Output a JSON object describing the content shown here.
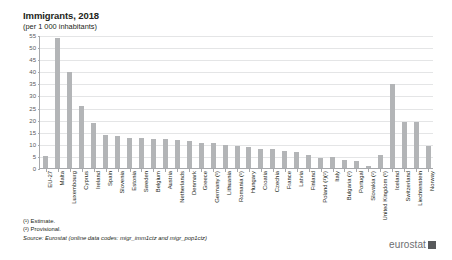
{
  "chart": {
    "title": "Immigrants, 2018",
    "subtitle": "(per 1 000 inhabitants)"
  },
  "footnotes": {
    "estimate": "(¹) Estimate.",
    "provisional": "(²) Provisional.",
    "source_label": "Source:",
    "source_text": "Eurostat (online data codes: migr_imm1ctz and migr_pop1ctz)"
  },
  "logo": {
    "wordmark": "eurostat",
    "mark_color": "#58595b"
  },
  "chart_data": {
    "type": "bar",
    "title": "Immigrants, 2018",
    "subtitle": "(per 1 000 inhabitants)",
    "xlabel": "",
    "ylabel": "",
    "ylim": [
      0,
      55
    ],
    "yticks": [
      0,
      5,
      10,
      15,
      20,
      25,
      30,
      35,
      40,
      45,
      50,
      55
    ],
    "grid": true,
    "legend": false,
    "bar_color": "#b3b5b7",
    "categories": [
      "EU-27",
      "Malta",
      "Luxembourg",
      "Cyprus",
      "Ireland",
      "Spain",
      "Slovenia",
      "Estonia",
      "Sweden",
      "Belgium",
      "Austria",
      "Netherlands",
      "Denmark",
      "Greece",
      "Germany (¹)",
      "Lithuania",
      "Romania (¹)",
      "Hungary",
      "Croatia",
      "Czechia",
      "France",
      "Latvia",
      "Finland",
      "Poland (¹)(²)",
      "Italy",
      "Bulgaria (²)",
      "Portugal",
      "Slovakia (²)",
      "United Kingdom (¹)",
      "Iceland",
      "Switzerland",
      "Liechtenstein",
      "Norway"
    ],
    "values": [
      5.3,
      54.2,
      40.3,
      25.9,
      19.1,
      14.0,
      13.8,
      13.0,
      12.9,
      12.6,
      12.3,
      11.9,
      11.4,
      10.9,
      10.8,
      10.1,
      9.4,
      9.0,
      8.3,
      8.1,
      7.5,
      7.1,
      5.6,
      4.5,
      5.0,
      3.7,
      3.4,
      1.3,
      5.9,
      35.3,
      19.5,
      19.4,
      9.5
    ]
  }
}
